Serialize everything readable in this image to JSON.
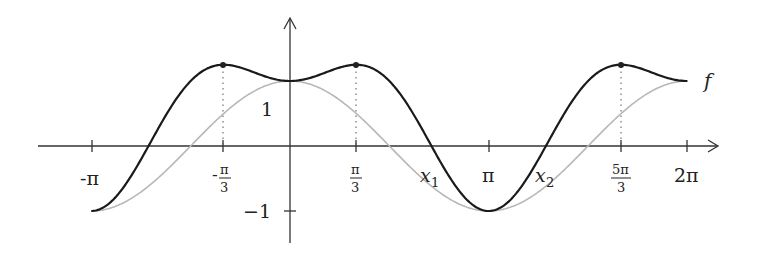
{
  "chart_data": {
    "type": "line",
    "title": "",
    "xlabel": "",
    "ylabel": "",
    "xlim": [
      -3.14159,
      6.28318
    ],
    "ylim": [
      -1,
      1.25
    ],
    "grid": false,
    "series": [
      {
        "name": "f",
        "description": "f(x) = cos x + sin² x",
        "color": "#1a1a1a",
        "x": [
          -3.1416,
          -2.618,
          -2.0944,
          -1.5708,
          -1.0472,
          -0.5236,
          0,
          0.5236,
          1.0472,
          1.5708,
          2.0944,
          2.618,
          3.1416,
          3.6652,
          4.1888,
          4.7124,
          5.236,
          5.7596,
          6.2832
        ],
        "y": [
          -1,
          -0.616,
          0.25,
          1,
          1.25,
          1.116,
          1,
          1.116,
          1.25,
          1,
          0.25,
          -0.616,
          -1,
          -0.616,
          0.25,
          1,
          1.25,
          1.116,
          1
        ]
      },
      {
        "name": "cos",
        "description": "cos x (grey reference curve)",
        "color": "#b8b8b8",
        "x": [
          -3.1416,
          -2.618,
          -2.0944,
          -1.5708,
          -1.0472,
          -0.5236,
          0,
          0.5236,
          1.0472,
          1.5708,
          2.0944,
          2.618,
          3.1416,
          3.6652,
          4.1888,
          4.7124,
          5.236,
          5.7596,
          6.2832
        ],
        "y": [
          -1,
          -0.866,
          -0.5,
          0,
          0.5,
          0.866,
          1,
          0.866,
          0.5,
          0,
          -0.5,
          -0.866,
          -1,
          -0.866,
          -0.5,
          0,
          0.5,
          0.866,
          1
        ]
      }
    ],
    "x_ticks": [
      {
        "value": -3.1416,
        "label": "-π"
      },
      {
        "value": -1.0472,
        "label": "-π/3"
      },
      {
        "value": 1.0472,
        "label": "π/3"
      },
      {
        "value": 3.1416,
        "label": "π"
      },
      {
        "value": 5.236,
        "label": "5π/3"
      },
      {
        "value": 6.2832,
        "label": "2π"
      }
    ],
    "y_ticks": [
      {
        "value": 1,
        "label": "1"
      },
      {
        "value": -1,
        "label": "-1"
      }
    ],
    "marked_points": [
      {
        "x": -1.0472,
        "y": 1.25
      },
      {
        "x": 1.0472,
        "y": 1.25
      },
      {
        "x": 5.236,
        "y": 1.25
      }
    ],
    "annotations": [
      {
        "label": "x1",
        "x": 2.2
      },
      {
        "label": "x2",
        "x": 4.08
      },
      {
        "label": "f",
        "position": "right end of curve"
      }
    ]
  },
  "labels": {
    "neg_pi": "-π",
    "neg_pi3_sign": "-",
    "pi_num": "π",
    "three": "3",
    "pi": "π",
    "five_pi": "5π",
    "two_pi": "2π",
    "x1_base": "x",
    "x1_sub": "1",
    "x2_base": "x",
    "x2_sub": "2",
    "one": "1",
    "minus_one": "−1",
    "f": "f"
  }
}
